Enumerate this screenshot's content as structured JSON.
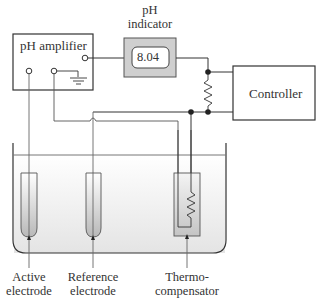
{
  "diagram": {
    "components": {
      "amplifier": {
        "label": "pH amplifier"
      },
      "indicator": {
        "label_line1": "pH",
        "label_line2": "indicator",
        "reading": "8.04"
      },
      "controller": {
        "label": "Controller"
      },
      "active_electrode": {
        "label_line1": "Active",
        "label_line2": "electrode"
      },
      "reference_electrode": {
        "label_line1": "Reference",
        "label_line2": "electrode"
      },
      "thermo_compensator": {
        "label_line1": "Thermo-",
        "label_line2": "compensator"
      }
    },
    "colors": {
      "line": "#333333",
      "indicator_fill": "#cfcfcf",
      "solution_top": "#ffffff",
      "solution_bottom": "#e6e6e6"
    }
  }
}
